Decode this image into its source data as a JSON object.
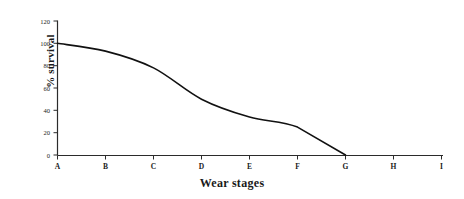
{
  "chart_data": {
    "type": "line",
    "title": "",
    "xlabel": "Wear stages",
    "ylabel": "% survival",
    "categories": [
      "A",
      "B",
      "C",
      "D",
      "E",
      "F",
      "G",
      "H",
      "I"
    ],
    "values": [
      100,
      93,
      78,
      50,
      34,
      25,
      0,
      null,
      null
    ],
    "series": [
      {
        "name": "% survival",
        "values": [
          100,
          93,
          78,
          50,
          34,
          25,
          0,
          null,
          null
        ]
      }
    ],
    "x": [
      "A",
      "B",
      "C",
      "D",
      "E",
      "F",
      "G",
      "H",
      "I"
    ],
    "ylim": [
      0,
      120
    ],
    "yticks": [
      0,
      20,
      40,
      60,
      80,
      100,
      120
    ],
    "ytick_labels": [
      "0",
      "20",
      "40",
      "60",
      "80",
      "100",
      "120"
    ],
    "xtick_labels": [
      "A",
      "B",
      "C",
      "D",
      "E",
      "F",
      "G",
      "H",
      "I"
    ],
    "grid": false,
    "legend": false,
    "legend_position": "none",
    "line_color": "#111111",
    "axis_color": "#2b2b2b",
    "background_color": "#ffffff"
  },
  "axes": {
    "y_ticks": [
      {
        "label": "120",
        "value": 120
      },
      {
        "label": "100",
        "value": 100
      },
      {
        "label": "80",
        "value": 80
      },
      {
        "label": "60",
        "value": 60
      },
      {
        "label": "40",
        "value": 40
      },
      {
        "label": "20",
        "value": 20
      },
      {
        "label": "0",
        "value": 0
      }
    ],
    "x_ticks": [
      {
        "label": "A"
      },
      {
        "label": "B"
      },
      {
        "label": "C"
      },
      {
        "label": "D"
      },
      {
        "label": "E"
      },
      {
        "label": "F"
      },
      {
        "label": "G"
      },
      {
        "label": "H"
      },
      {
        "label": "I"
      }
    ],
    "ylabel": "% survival",
    "xlabel": "Wear stages"
  }
}
